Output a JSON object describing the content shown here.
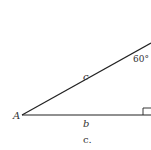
{
  "diagram": {
    "type": "right-triangle",
    "vertex_label": "A",
    "hypotenuse_label": "c",
    "adjacent_label": "b",
    "angle_label": "60°",
    "caption": "c.",
    "line_color": "#222222",
    "right_angle_marker": true
  }
}
